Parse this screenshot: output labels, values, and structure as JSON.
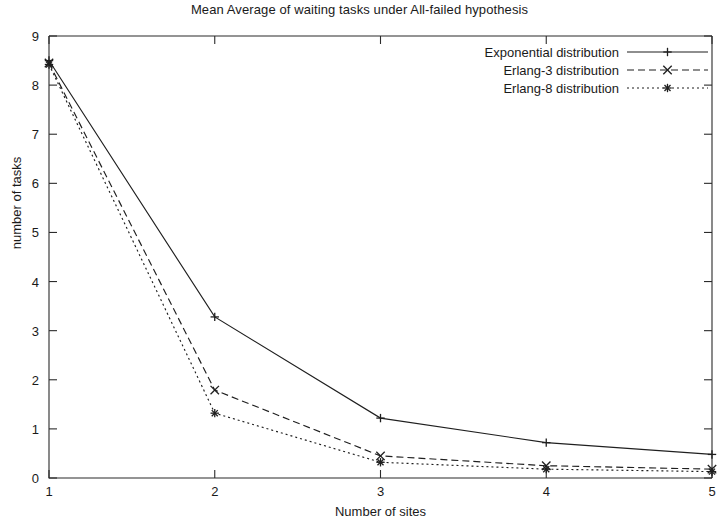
{
  "chart_data": {
    "type": "line",
    "title": "Mean Average of waiting tasks under All-failed hypothesis",
    "xlabel": "Number of sites",
    "ylabel": "number of tasks",
    "xlim": [
      1,
      5
    ],
    "ylim": [
      0,
      9
    ],
    "x": [
      1,
      2,
      3,
      4,
      5
    ],
    "xticks": [
      "1",
      "2",
      "3",
      "4",
      "5"
    ],
    "yticks": [
      "0",
      "1",
      "2",
      "3",
      "4",
      "5",
      "6",
      "7",
      "8",
      "9"
    ],
    "grid": false,
    "legend_position": "top-right",
    "series": [
      {
        "name": "Exponential distribution",
        "marker": "plus",
        "dash": "solid",
        "values": [
          8.5,
          3.28,
          1.22,
          0.72,
          0.48
        ]
      },
      {
        "name": "Erlang-3 distribution",
        "marker": "cross",
        "dash": "dashed",
        "values": [
          8.45,
          1.79,
          0.45,
          0.25,
          0.18
        ]
      },
      {
        "name": "Erlang-8 distribution",
        "marker": "star",
        "dash": "dotted",
        "values": [
          8.42,
          1.32,
          0.32,
          0.18,
          0.13
        ]
      }
    ]
  },
  "colors": {
    "ink": "#1f1f1f",
    "axis": "#2b2b2b",
    "background": "#ffffff"
  }
}
